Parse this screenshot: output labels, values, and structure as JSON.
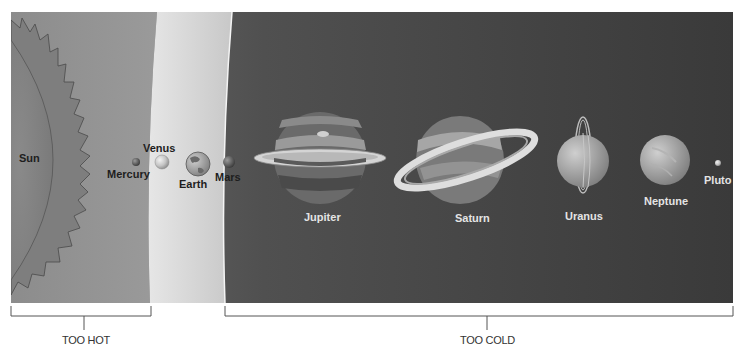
{
  "diagram": {
    "title": "",
    "sun_label": "Sun",
    "planets": [
      {
        "name": "Mercury",
        "label": "Mercury"
      },
      {
        "name": "Venus",
        "label": "Venus"
      },
      {
        "name": "Earth",
        "label": "Earth"
      },
      {
        "name": "Mars",
        "label": "Mars"
      },
      {
        "name": "Jupiter",
        "label": "Jupiter"
      },
      {
        "name": "Saturn",
        "label": "Saturn"
      },
      {
        "name": "Uranus",
        "label": "Uranus"
      },
      {
        "name": "Neptune",
        "label": "Neptune"
      },
      {
        "name": "Pluto",
        "label": "Pluto"
      }
    ],
    "zones": {
      "hot": "TOO HOT",
      "cold": "TOO COLD"
    },
    "colors": {
      "hot_zone": "#8a8a8a",
      "habitable_zone": "#d8d8d8",
      "cold_zone": "#4a4a4a"
    }
  }
}
